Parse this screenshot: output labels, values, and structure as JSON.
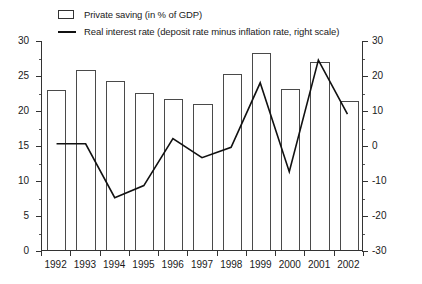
{
  "legend": {
    "items": [
      {
        "label": "Private saving (in % of GDP)",
        "marker": "bar-swatch-icon"
      },
      {
        "label": "Real interest rate (deposit rate minus inflation rate, right scale)",
        "marker": "line-swatch-icon"
      }
    ]
  },
  "axes": {
    "left_ticks": [
      "0",
      "5",
      "10",
      "15",
      "20",
      "25",
      "30"
    ],
    "right_ticks": [
      "-30",
      "-20",
      "-10",
      "0",
      "10",
      "20",
      "30"
    ],
    "x_ticks": [
      "1992",
      "1993",
      "1994",
      "1995",
      "1996",
      "1997",
      "1998",
      "1999",
      "2000",
      "2001",
      "2002"
    ]
  },
  "colors": {
    "bar_stroke": "#4a4a4a",
    "bar_fill": "#ffffff",
    "line": "#111111",
    "axis": "#333333",
    "background": "#ffffff"
  },
  "chart_data": {
    "type": "bar",
    "title": "",
    "subtitle": "",
    "xlabel": "",
    "ylabel": "",
    "y2label": "",
    "grid": false,
    "legend_position": "top",
    "categories": [
      "1992",
      "1993",
      "1994",
      "1995",
      "1996",
      "1997",
      "1998",
      "1999",
      "2000",
      "2001",
      "2002"
    ],
    "ylim": [
      0,
      30
    ],
    "y2lim": [
      -30,
      30
    ],
    "series": [
      {
        "name": "Private saving (in % of GDP)",
        "type": "bar",
        "axis": "left",
        "unit": "% of GDP",
        "values": [
          22.8,
          25.7,
          24.2,
          22.5,
          21.6,
          20.8,
          25.2,
          28.2,
          23.0,
          26.8,
          21.3
        ]
      },
      {
        "name": "Real interest rate (deposit rate minus inflation rate, right scale)",
        "type": "line",
        "axis": "right",
        "unit": "percent",
        "values": [
          0.5,
          0.5,
          -15.0,
          -11.5,
          2.0,
          -3.5,
          -0.5,
          18.0,
          -7.5,
          24.5,
          9.0
        ]
      }
    ]
  }
}
